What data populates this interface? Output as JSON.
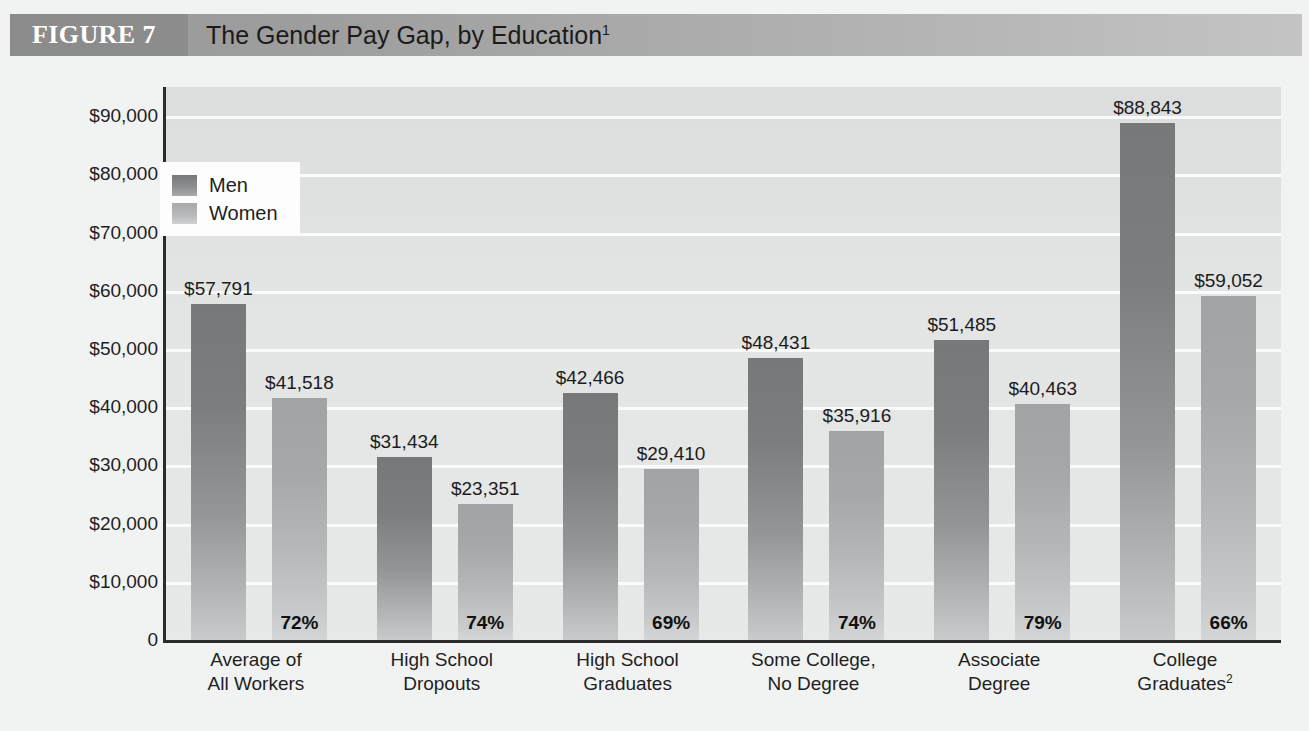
{
  "header": {
    "figure_tag": "FIGURE 7",
    "title": "The Gender Pay Gap, by Education",
    "title_footnote": "1"
  },
  "legend": {
    "men_label": "Men",
    "women_label": "Women",
    "men_color": "#8e8f90",
    "women_color": "#b9babb"
  },
  "axes": {
    "y_title": "Earnings per year",
    "y_ticks": [
      "$90,000",
      "$80,000",
      "$70,000",
      "$60,000",
      "$50,000",
      "$40,000",
      "$30,000",
      "$20,000",
      "$10,000",
      "0"
    ]
  },
  "chart_data": {
    "type": "bar",
    "title": "The Gender Pay Gap, by Education",
    "xlabel": "",
    "ylabel": "Earnings per year",
    "ylim": [
      0,
      95000
    ],
    "ytick_values": [
      0,
      10000,
      20000,
      30000,
      40000,
      50000,
      60000,
      70000,
      80000,
      90000
    ],
    "grid": true,
    "legend_position": "upper-left-inside",
    "categories": [
      "Average of All Workers",
      "High School Dropouts",
      "High School Graduates",
      "Some College, No Degree",
      "Associate Degree",
      "College Graduates"
    ],
    "category_lines": [
      [
        "Average of",
        "All Workers"
      ],
      [
        "High School",
        "Dropouts"
      ],
      [
        "High School",
        "Graduates"
      ],
      [
        "Some College,",
        "No Degree"
      ],
      [
        "Associate",
        "Degree"
      ],
      [
        "College",
        "Graduates"
      ]
    ],
    "category_footnotes": [
      "",
      "",
      "",
      "",
      "",
      "2"
    ],
    "series": [
      {
        "name": "Men",
        "values": [
          57791,
          31434,
          42466,
          48431,
          51485,
          88843
        ],
        "labels": [
          "$57,791",
          "$31,434",
          "$42,466",
          "$48,431",
          "$51,485",
          "$88,843"
        ]
      },
      {
        "name": "Women",
        "values": [
          41518,
          23351,
          29410,
          35916,
          40463,
          59052
        ],
        "labels": [
          "$41,518",
          "$23,351",
          "$29,410",
          "$35,916",
          "$40,463",
          "$59,052"
        ]
      }
    ],
    "ratio_labels": [
      "72%",
      "74%",
      "69%",
      "74%",
      "79%",
      "66%"
    ],
    "annotations": [
      "Women's earnings as a percentage of men's earnings shown at base of each women's bar"
    ]
  }
}
